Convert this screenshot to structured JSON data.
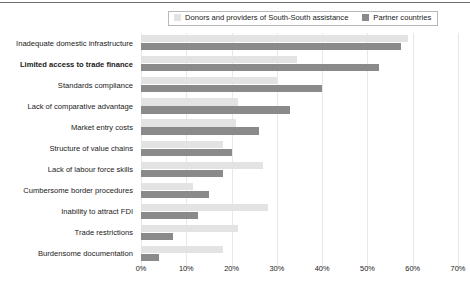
{
  "legend": {
    "entries": [
      {
        "label": "Donors and providers of South-South assistance",
        "color": "#e3e3e3",
        "swatch": "light"
      },
      {
        "label": "Partner countries",
        "color": "#8a8a8a",
        "swatch": "dark"
      }
    ]
  },
  "chart_data": {
    "type": "bar",
    "orientation": "horizontal",
    "title": "",
    "xlabel": "",
    "ylabel": "",
    "xlim": [
      0,
      70
    ],
    "xticks": [
      "0%",
      "10%",
      "20%",
      "30%",
      "40%",
      "50%",
      "60%",
      "70%"
    ],
    "xtick_values": [
      0,
      10,
      20,
      30,
      40,
      50,
      60,
      70
    ],
    "grid": true,
    "legend_position": "top",
    "categories": [
      "Inadequate domestic infrastructure",
      "Limited access to trade finance",
      "Standards compliance",
      "Lack of comparative advantage",
      "Market entry costs",
      "Structure of value chains",
      "Lack of labour force skills",
      "Cumbersome border procedures",
      "Inability to attract FDI",
      "Trade restrictions",
      "Burdensome documentation"
    ],
    "emphasized_categories": [
      "Limited access to trade finance"
    ],
    "series": [
      {
        "name": "Donors and providers of South-South assistance",
        "color": "#e3e3e3",
        "values": [
          59,
          34.5,
          30,
          21.5,
          21,
          18,
          27,
          11.5,
          28,
          21.5,
          18
        ]
      },
      {
        "name": "Partner countries",
        "color": "#8a8a8a",
        "values": [
          57.5,
          52.5,
          40,
          33,
          26,
          20,
          18,
          15,
          12.5,
          7,
          4
        ]
      }
    ]
  }
}
